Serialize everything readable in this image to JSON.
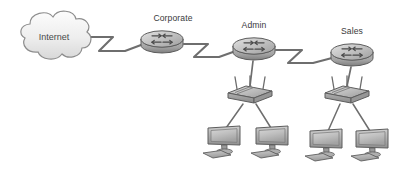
{
  "diagram": {
    "type": "network-topology",
    "background_color": "#ffffff",
    "width": 396,
    "height": 173,
    "line_color": "#6e6e6e",
    "device_fill": "#b9b9b9",
    "device_stroke": "#5a5a5a",
    "label_color": "#3a3a3a"
  },
  "cloud": {
    "label": "Internet",
    "cx": 52,
    "cy": 38
  },
  "routers": [
    {
      "id": "corporate",
      "label": "Corporate",
      "cx": 162,
      "cy": 41,
      "label_x": 173,
      "label_y": 22
    },
    {
      "id": "admin",
      "label": "Admin",
      "cx": 254,
      "cy": 48,
      "label_x": 254,
      "label_y": 29
    },
    {
      "id": "sales",
      "label": "Sales",
      "cx": 352,
      "cy": 54,
      "label_x": 352,
      "label_y": 35
    }
  ],
  "switches": [
    {
      "id": "admin-switch",
      "cx": 250,
      "cy": 95
    },
    {
      "id": "sales-switch",
      "cx": 347,
      "cy": 95
    }
  ],
  "workstations": [
    {
      "id": "admin-pc-1",
      "cx": 224,
      "cy": 142
    },
    {
      "id": "admin-pc-2",
      "cx": 272,
      "cy": 142
    },
    {
      "id": "sales-pc-1",
      "cx": 326,
      "cy": 145
    },
    {
      "id": "sales-pc-2",
      "cx": 372,
      "cy": 145
    }
  ],
  "links": [
    {
      "id": "internet-to-corporate",
      "style": "serial-zigzag",
      "from": "cloud",
      "to": "corporate"
    },
    {
      "id": "corporate-to-admin",
      "style": "serial-zigzag",
      "from": "corporate",
      "to": "admin"
    },
    {
      "id": "admin-to-sales",
      "style": "serial-zigzag",
      "from": "admin",
      "to": "sales"
    },
    {
      "id": "admin-router-to-switch",
      "style": "straight",
      "from": "admin",
      "to": "admin-switch"
    },
    {
      "id": "sales-router-to-switch",
      "style": "straight",
      "from": "sales",
      "to": "sales-switch"
    },
    {
      "id": "admin-switch-to-pc-1",
      "style": "straight",
      "from": "admin-switch",
      "to": "admin-pc-1"
    },
    {
      "id": "admin-switch-to-pc-2",
      "style": "straight",
      "from": "admin-switch",
      "to": "admin-pc-2"
    },
    {
      "id": "sales-switch-to-pc-1",
      "style": "straight",
      "from": "sales-switch",
      "to": "sales-pc-1"
    },
    {
      "id": "sales-switch-to-pc-2",
      "style": "straight",
      "from": "sales-switch",
      "to": "sales-pc-2"
    }
  ]
}
